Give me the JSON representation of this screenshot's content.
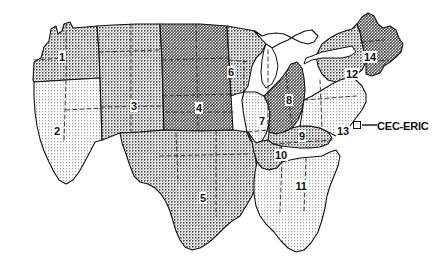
{
  "figure": {
    "type": "map",
    "background_color": "#ffffff",
    "outline_color": "#111111",
    "width": 439,
    "height": 272
  },
  "regions": [
    {
      "id": "1",
      "label": "1",
      "x": 62,
      "y": 57,
      "shade": "medium",
      "area": "Pacific Northwest"
    },
    {
      "id": "2",
      "label": "2",
      "x": 57,
      "y": 131,
      "shade": "light",
      "area": "California / Nevada"
    },
    {
      "id": "3",
      "label": "3",
      "x": 134,
      "y": 106,
      "shade": "medium",
      "area": "Mountain West"
    },
    {
      "id": "4",
      "label": "4",
      "x": 199,
      "y": 108,
      "shade": "dark",
      "area": "Central Plains"
    },
    {
      "id": "5",
      "label": "5",
      "x": 203,
      "y": 198,
      "shade": "medium",
      "area": "Texas / Oklahoma"
    },
    {
      "id": "6",
      "label": "6",
      "x": 231,
      "y": 72,
      "shade": "medium",
      "area": "Upper Midwest"
    },
    {
      "id": "7",
      "label": "7",
      "x": 262,
      "y": 121,
      "shade": "light",
      "area": "Illinois"
    },
    {
      "id": "8",
      "label": "8",
      "x": 289,
      "y": 100,
      "shade": "dark",
      "area": "Michigan / Indiana"
    },
    {
      "id": "9",
      "label": "9",
      "x": 302,
      "y": 136,
      "shade": "medium",
      "area": "Kentucky / Tennessee"
    },
    {
      "id": "10",
      "label": "10",
      "x": 281,
      "y": 155,
      "shade": "medium",
      "area": "Arkansas / Mississippi"
    },
    {
      "id": "11",
      "label": "11",
      "x": 301,
      "y": 186,
      "shade": "light",
      "area": "Deep South / Florida"
    },
    {
      "id": "12",
      "label": "12",
      "x": 352,
      "y": 74,
      "shade": "medium",
      "area": "New York"
    },
    {
      "id": "13",
      "label": "13",
      "x": 343,
      "y": 131,
      "shade": "light",
      "area": "Mid-Atlantic"
    },
    {
      "id": "14",
      "label": "14",
      "x": 370,
      "y": 57,
      "shade": "dark",
      "area": "New England"
    }
  ],
  "callout": {
    "label": "CEC-ERIC",
    "label_x": 377,
    "label_y": 126,
    "marker_x": 357,
    "marker_y": 125,
    "leader_from_x": 362,
    "leader_from_y": 125,
    "leader_to_x": 376,
    "leader_to_y": 125
  }
}
